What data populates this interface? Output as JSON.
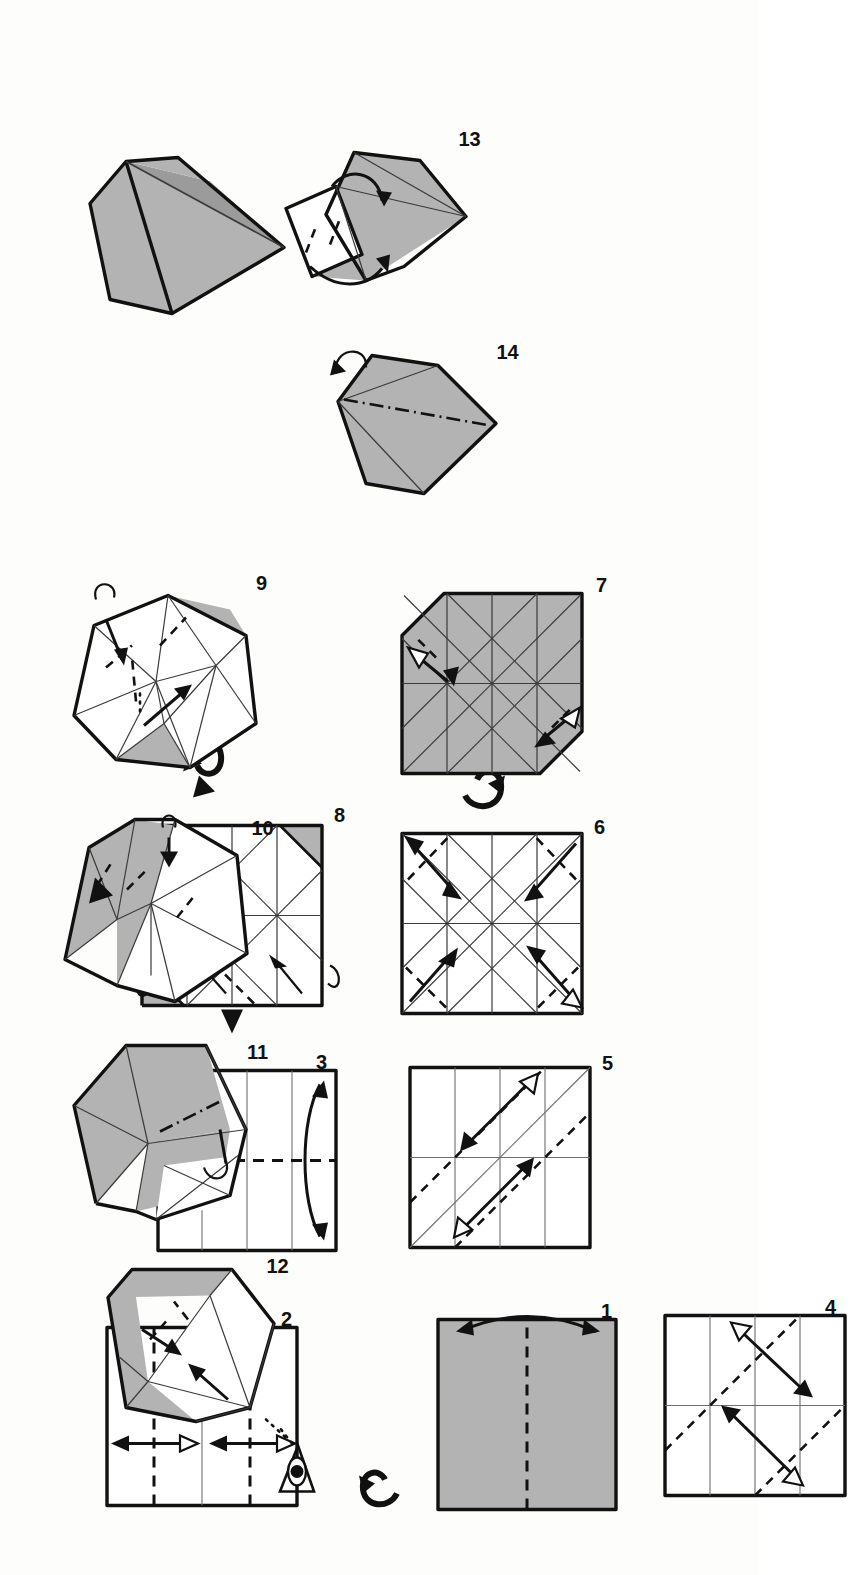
{
  "document": {
    "kind": "origami-folding-diagram",
    "orientation": "page scanned sideways; step numbers read rotated 90 degrees",
    "total_numbered_steps": 14,
    "has_final_model": true,
    "page_background": "#fdfdfc",
    "ink_color": "#111111",
    "paper_colored_side": "#b3b3b3",
    "paper_white_side": "#ffffff",
    "crease_line_color": "#6e6e6e"
  },
  "legend": {
    "valley_fold": "dashed line",
    "mountain_fold": "dash-dot line",
    "existing_crease": "thin solid line",
    "fold_arrow": "solid arrow",
    "fold_and_unfold_arrow": "double-headed arrow",
    "turn_over": "looped arrow",
    "view_direction": "eye symbol with dotted sight line",
    "push_here": "filled black triangle"
  },
  "steps": [
    {
      "number": "1",
      "label": "1",
      "shape": "square",
      "face": "colored",
      "creases": [
        "horizontal center valley fold"
      ],
      "arrows": [
        "fold in half and unfold"
      ],
      "symbols": []
    },
    {
      "number": "2",
      "label": "2",
      "shape": "square",
      "face": "white",
      "creases": [
        "horizontal center crease",
        "two horizontal quarter valley folds"
      ],
      "arrows": [
        "fold and unfold top quarter",
        "fold and unfold bottom quarter"
      ],
      "symbols": [
        "turn-over"
      ]
    },
    {
      "number": "3",
      "label": "3",
      "shape": "square",
      "face": "white",
      "creases": [
        "three horizontal creases",
        "vertical center valley fold"
      ],
      "arrows": [
        "fold in half and unfold sideways"
      ],
      "symbols": []
    },
    {
      "number": "4",
      "label": "4",
      "shape": "square",
      "face": "white",
      "creases": [
        "4x4 grid creases",
        "two parallel diagonal valley folds"
      ],
      "arrows": [
        "fold and unfold on lower-left diagonal",
        "fold and unfold on upper-right diagonal"
      ],
      "symbols": []
    },
    {
      "number": "5",
      "label": "5",
      "shape": "square",
      "face": "white",
      "creases": [
        "4x4 grid creases",
        "main diagonal",
        "two parallel diagonal valley folds"
      ],
      "arrows": [
        "fold and unfold on upper-left diagonal",
        "fold and unfold on lower-right diagonal"
      ],
      "symbols": []
    },
    {
      "number": "6",
      "label": "6",
      "shape": "square",
      "face": "white",
      "creases": [
        "complete diagonal grid crease pattern"
      ],
      "arrows": [
        "four corner fold-and-unfold double arrows"
      ],
      "symbols": [
        "turn-over"
      ]
    },
    {
      "number": "7",
      "label": "7",
      "shape": "octagon (two corners blunted)",
      "face": "colored",
      "creases": [
        "complete diagonal grid crease pattern"
      ],
      "arrows": [
        "two corner fold-and-unfold double arrows"
      ],
      "symbols": [
        "turn-over"
      ]
    },
    {
      "number": "8",
      "label": "8",
      "shape": "square with two folded corners",
      "face": "white with colored folded corners",
      "creases": [
        "complete diagonal grid crease pattern",
        "diagonal valley fold at left"
      ],
      "arrows": [
        "two small fold arrows",
        "two loop arrows at corners"
      ],
      "symbols": [
        "push-here triangle"
      ]
    },
    {
      "number": "9",
      "label": "9",
      "shape": "partially collapsed 3D form",
      "face": "white with colored edges",
      "creases": [
        "radiating collapse creases"
      ],
      "arrows": [
        "collapse arrow",
        "tuck arrow",
        "loop arrow"
      ],
      "symbols": []
    },
    {
      "number": "10",
      "label": "10",
      "shape": "3D box-like form",
      "face": "colored top flaps, white underside",
      "creases": [
        "internal fold lines"
      ],
      "arrows": [
        "push arrow",
        "loop arrow"
      ],
      "symbols": [
        "push-here triangle"
      ]
    },
    {
      "number": "11",
      "label": "11",
      "shape": "3D open form",
      "face": "colored upper, white lower",
      "creases": [
        "mountain dash-dot crease"
      ],
      "arrows": [
        "loop arrow"
      ],
      "symbols": []
    },
    {
      "number": "12",
      "label": "12",
      "shape": "3D closed box form",
      "face": "colored panels",
      "creases": [
        "internal creases"
      ],
      "arrows": [
        "two closing arrows"
      ],
      "symbols": [
        "eye view-direction symbol with dotted sight line"
      ]
    },
    {
      "number": "13",
      "label": "13",
      "shape": "3D kite with flap lifted",
      "face": "colored body, white flap",
      "creases": [
        "flap fold line"
      ],
      "arrows": [
        "rotate flap down arrow",
        "loop arrow"
      ],
      "symbols": []
    },
    {
      "number": "14",
      "label": "14",
      "shape": "3D kite",
      "face": "colored",
      "creases": [
        "central mountain dash-dot crease"
      ],
      "arrows": [
        "small loop arrow at top"
      ],
      "symbols": []
    }
  ],
  "final_model": {
    "label": "",
    "description": "finished three-dimensional gem / kite shaped model",
    "face": "colored"
  }
}
